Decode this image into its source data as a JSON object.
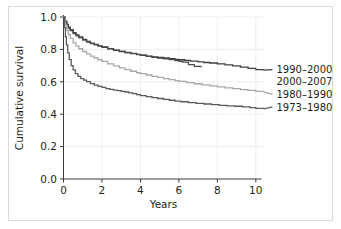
{
  "chart_data": {
    "type": "line",
    "title": "",
    "xlabel": "Years",
    "ylabel": "Cumulative survival",
    "xlim": [
      0,
      10.4
    ],
    "ylim": [
      0,
      1.0
    ],
    "xticks": [
      0,
      2,
      4,
      6,
      8,
      10
    ],
    "xtick_labels": [
      "0",
      "2",
      "4",
      "6",
      "8",
      "10"
    ],
    "yticks": [
      0.0,
      0.2,
      0.4,
      0.6,
      0.8,
      1.0
    ],
    "ytick_labels": [
      "0.0",
      "0.2",
      "0.4",
      "0.6",
      "0.8",
      "1.0"
    ],
    "grid": true,
    "legend_position": "right-inline",
    "series": [
      {
        "name": "1990-2000",
        "label": "1990–2000",
        "color": "#3f3f3f",
        "label_y": 0.675,
        "x": [
          0,
          0.08,
          0.17,
          0.25,
          0.35,
          0.5,
          0.65,
          0.8,
          1.0,
          1.2,
          1.4,
          1.6,
          1.8,
          2.0,
          2.3,
          2.6,
          2.9,
          3.2,
          3.5,
          3.8,
          4.0,
          4.3,
          4.6,
          4.9,
          5.2,
          5.5,
          5.8,
          6.0,
          6.3,
          6.6,
          7.0,
          7.3,
          7.6,
          8.0,
          8.4,
          8.8,
          9.2,
          9.6,
          10.0,
          10.4
        ],
        "y": [
          1.0,
          0.975,
          0.955,
          0.938,
          0.922,
          0.903,
          0.889,
          0.877,
          0.862,
          0.849,
          0.839,
          0.831,
          0.822,
          0.815,
          0.805,
          0.796,
          0.788,
          0.781,
          0.775,
          0.769,
          0.765,
          0.759,
          0.754,
          0.75,
          0.747,
          0.743,
          0.739,
          0.736,
          0.732,
          0.728,
          0.723,
          0.719,
          0.716,
          0.711,
          0.705,
          0.698,
          0.691,
          0.683,
          0.675,
          0.672
        ]
      },
      {
        "name": "2000-2007",
        "label": "2000–2007",
        "color": "#4a4a4a",
        "label_y": 0.6,
        "truncated_at": 7.15,
        "x": [
          0,
          0.08,
          0.17,
          0.25,
          0.35,
          0.5,
          0.65,
          0.8,
          1.0,
          1.2,
          1.4,
          1.6,
          1.8,
          2.0,
          2.3,
          2.6,
          2.9,
          3.2,
          3.5,
          3.8,
          4.0,
          4.3,
          4.6,
          4.9,
          5.2,
          5.5,
          5.8,
          6.0,
          6.2,
          6.5,
          6.8,
          7.15
        ],
        "y": [
          1.0,
          0.972,
          0.95,
          0.932,
          0.916,
          0.897,
          0.883,
          0.871,
          0.857,
          0.845,
          0.836,
          0.828,
          0.82,
          0.813,
          0.803,
          0.794,
          0.787,
          0.78,
          0.774,
          0.768,
          0.764,
          0.757,
          0.751,
          0.746,
          0.742,
          0.737,
          0.731,
          0.727,
          0.721,
          0.706,
          0.695,
          0.69
        ]
      },
      {
        "name": "1980-1990",
        "label": "1980–1990",
        "color": "#a8a8a8",
        "label_y": 0.523,
        "x": [
          0,
          0.08,
          0.17,
          0.25,
          0.35,
          0.5,
          0.65,
          0.8,
          1.0,
          1.2,
          1.4,
          1.6,
          1.8,
          2.0,
          2.3,
          2.6,
          2.9,
          3.2,
          3.5,
          3.8,
          4.0,
          4.3,
          4.6,
          4.9,
          5.2,
          5.5,
          5.8,
          6.0,
          6.4,
          6.8,
          7.2,
          7.6,
          8.0,
          8.4,
          8.8,
          9.2,
          9.6,
          10.0,
          10.4
        ],
        "y": [
          1.0,
          0.952,
          0.918,
          0.892,
          0.868,
          0.84,
          0.82,
          0.804,
          0.787,
          0.772,
          0.759,
          0.747,
          0.736,
          0.726,
          0.711,
          0.698,
          0.686,
          0.675,
          0.665,
          0.656,
          0.65,
          0.642,
          0.634,
          0.627,
          0.62,
          0.613,
          0.607,
          0.603,
          0.595,
          0.588,
          0.581,
          0.575,
          0.569,
          0.563,
          0.558,
          0.552,
          0.547,
          0.541,
          0.538
        ]
      },
      {
        "name": "1973-1980",
        "label": "1973–1980",
        "color": "#5a5a5a",
        "label_y": 0.445,
        "x": [
          0,
          0.05,
          0.1,
          0.15,
          0.22,
          0.3,
          0.4,
          0.5,
          0.62,
          0.75,
          0.9,
          1.05,
          1.2,
          1.4,
          1.6,
          1.8,
          2.0,
          2.2,
          2.4,
          2.6,
          2.8,
          3.0,
          3.2,
          3.4,
          3.6,
          3.8,
          4.0,
          4.3,
          4.6,
          4.9,
          5.2,
          5.5,
          5.8,
          6.1,
          6.5,
          6.9,
          7.3,
          7.7,
          8.1,
          8.5,
          8.9,
          9.3,
          9.7,
          10.0,
          10.4
        ],
        "y": [
          1.0,
          0.935,
          0.878,
          0.828,
          0.779,
          0.737,
          0.7,
          0.673,
          0.65,
          0.633,
          0.62,
          0.61,
          0.601,
          0.589,
          0.58,
          0.572,
          0.565,
          0.558,
          0.553,
          0.549,
          0.545,
          0.541,
          0.537,
          0.532,
          0.527,
          0.521,
          0.515,
          0.508,
          0.502,
          0.497,
          0.491,
          0.486,
          0.481,
          0.477,
          0.472,
          0.467,
          0.463,
          0.459,
          0.455,
          0.452,
          0.449,
          0.445,
          0.44,
          0.436,
          0.433
        ]
      }
    ]
  }
}
